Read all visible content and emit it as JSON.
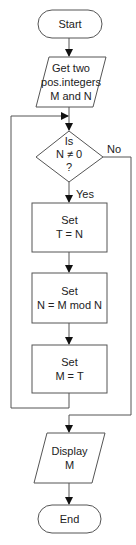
{
  "diagram": {
    "type": "flowchart",
    "colors": {
      "stroke": "#555555",
      "text": "#222222",
      "background": "#ffffff"
    },
    "nodes": {
      "start": {
        "shape": "terminator",
        "label": "Start"
      },
      "input": {
        "shape": "parallelogram",
        "line1": "Get two",
        "line2": "pos.integers",
        "line3": "M and N"
      },
      "decision": {
        "shape": "diamond",
        "line1": "Is",
        "line2": "N ≠ 0",
        "line3": "?"
      },
      "set_t": {
        "shape": "rectangle",
        "line1": "Set",
        "line2": "T = N"
      },
      "set_n": {
        "shape": "rectangle",
        "line1": "Set",
        "line2": "N = M mod N"
      },
      "set_m": {
        "shape": "rectangle",
        "line1": "Set",
        "line2": "M = T"
      },
      "output": {
        "shape": "parallelogram",
        "line1": "Display",
        "line2": "M"
      },
      "end": {
        "shape": "terminator",
        "label": "End"
      }
    },
    "edge_labels": {
      "yes": "Yes",
      "no": "No"
    },
    "edges": [
      {
        "from": "start",
        "to": "input"
      },
      {
        "from": "input",
        "to": "decision"
      },
      {
        "from": "decision",
        "to": "set_t",
        "label": "Yes"
      },
      {
        "from": "set_t",
        "to": "set_n"
      },
      {
        "from": "set_n",
        "to": "set_m"
      },
      {
        "from": "set_m",
        "to": "decision",
        "note": "loop back"
      },
      {
        "from": "decision",
        "to": "output",
        "label": "No"
      },
      {
        "from": "output",
        "to": "end"
      }
    ]
  }
}
